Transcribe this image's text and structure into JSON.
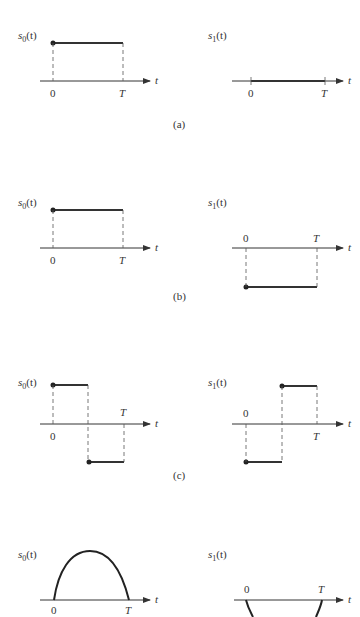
{
  "figure": {
    "panels": [
      {
        "caption": "(a)",
        "s0": {
          "label": "s0(t)",
          "label_main": "s",
          "label_sub": "0",
          "label_arg": "(t)",
          "description": "constant positive pulse from 0 to T"
        },
        "s1": {
          "label": "s1(t)",
          "label_main": "s",
          "label_sub": "1",
          "label_arg": "(t)",
          "description": "zero signal from 0 to T"
        }
      },
      {
        "caption": "(b)",
        "s0": {
          "label": "s0(t)",
          "label_main": "s",
          "label_sub": "0",
          "label_arg": "(t)",
          "description": "constant positive pulse from 0 to T"
        },
        "s1": {
          "label": "s1(t)",
          "label_main": "s",
          "label_sub": "1",
          "label_arg": "(t)",
          "description": "constant negative pulse from 0 to T"
        }
      },
      {
        "caption": "(c)",
        "s0": {
          "label": "s0(t)",
          "label_main": "s",
          "label_sub": "0",
          "label_arg": "(t)",
          "description": "positive first half, negative second half"
        },
        "s1": {
          "label": "s1(t)",
          "label_main": "s",
          "label_sub": "1",
          "label_arg": "(t)",
          "description": "negative first half, positive second half"
        }
      },
      {
        "caption": "",
        "s0": {
          "label": "s0(t)",
          "label_main": "s",
          "label_sub": "0",
          "label_arg": "(t)",
          "description": "positive half-sine arch from 0 to T"
        },
        "s1": {
          "label": "s1(t)",
          "label_main": "s",
          "label_sub": "1",
          "label_arg": "(t)",
          "description": "negative half-sine arch from 0 to T (cropped)"
        }
      }
    ],
    "axis": {
      "var": "t",
      "tick_zero": "0",
      "tick_end": "T"
    }
  }
}
